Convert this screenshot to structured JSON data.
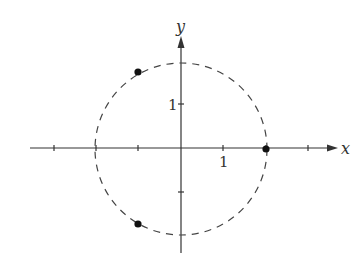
{
  "diagram": {
    "axes": {
      "x_label": "x",
      "y_label": "y",
      "x_tick_label": "1",
      "y_tick_label": "1",
      "x_ticks": [
        -3,
        -2,
        -1,
        1,
        2,
        3
      ],
      "y_ticks": [
        -1,
        1
      ]
    },
    "circle": {
      "center": [
        0,
        0
      ],
      "radius": 2,
      "style": "dashed"
    },
    "points": [
      {
        "x": 2,
        "y": 0
      },
      {
        "x": -1,
        "y": 1.732
      },
      {
        "x": -1,
        "y": -1.732
      }
    ],
    "colors": {
      "axis": "#333333",
      "circle": "#444444",
      "points": "#111111"
    }
  }
}
